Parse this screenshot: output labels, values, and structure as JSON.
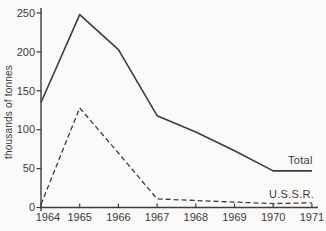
{
  "chart_data": {
    "type": "line",
    "title": "",
    "xlabel": "",
    "ylabel": "thousands of tonnes",
    "x": [
      1964,
      1965,
      1966,
      1967,
      1968,
      1969,
      1970,
      1971
    ],
    "series": [
      {
        "name": "Total",
        "style": "solid",
        "values": [
          135,
          248,
          203,
          118,
          97,
          73,
          47,
          47
        ]
      },
      {
        "name": "U.S.S.R.",
        "style": "dashed",
        "values": [
          4,
          128,
          70,
          11,
          9,
          7,
          5,
          6
        ]
      }
    ],
    "ylim": [
      0,
      250
    ],
    "yticks": [
      0,
      50,
      100,
      150,
      200,
      250
    ],
    "grid": false,
    "legend_position": "inline-right-of-lines",
    "line_color": "#3d3d3d",
    "axis_color": "#3d3d3d",
    "text_color": "#3a3a3a",
    "background": "#fbfaf8"
  }
}
